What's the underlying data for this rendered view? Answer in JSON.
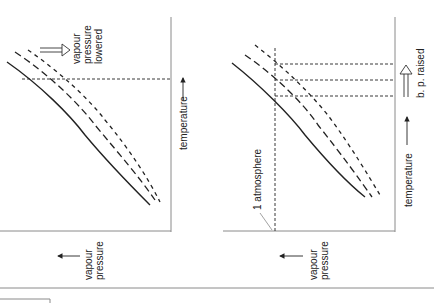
{
  "figure": {
    "orientation": "rotated 90 degrees clockwise",
    "left_panel": {
      "x_axis_label": "temperature",
      "y_axis_label_line1": "vapour",
      "y_axis_label_line2": "pressure",
      "annotation_line1": "vapour",
      "annotation_line2": "pressure",
      "annotation_line3": "lowered",
      "curves": [
        "pure solvent (solid)",
        "solution (dashed)",
        "more concentrated solution (short dashed)"
      ]
    },
    "right_panel": {
      "x_axis_label": "temperature",
      "y_axis_label_line1": "vapour",
      "y_axis_label_line2": "pressure",
      "reference_label": "1 atmosphere",
      "annotation": "b. p. raised",
      "curves": [
        "pure solvent (solid)",
        "solution (dashed)",
        "more concentrated solution (short dashed)"
      ]
    },
    "colors": {
      "ink": "#222222",
      "axis": "#8a8a8a"
    }
  }
}
